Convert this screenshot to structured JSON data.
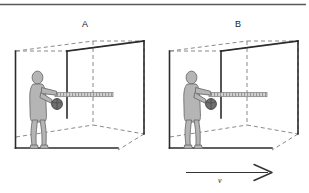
{
  "figure": {
    "type": "physics-diagram",
    "background_color": "#ffffff",
    "rule_color": "#595959",
    "panels": [
      {
        "id": "A",
        "label": "A",
        "label_x": 85,
        "label_y": 25,
        "box": {
          "style": "wireframe-perspective",
          "solid_edge_color": "#2b2b2b",
          "dashed_edge_color": "#777777",
          "front_left_vertical": true,
          "floor_line": true
        },
        "person": {
          "pose": "standing-arm-extended-throwing",
          "fill_color": "#b3b3b3",
          "outline_color": "#6e6e6e",
          "facing": "right"
        },
        "ball": {
          "shape": "sphere",
          "fill_color": "#6b6b6b",
          "outline_color": "#3a3a3a"
        },
        "trajectory_bar": {
          "style": "hatched-horizontal-bar",
          "fill_color": "#cfcfcf",
          "hatch_color": "#8a8a8a",
          "direction": "right"
        }
      },
      {
        "id": "B",
        "label": "B",
        "label_x": 238,
        "label_y": 25,
        "box": {
          "style": "wireframe-perspective",
          "solid_edge_color": "#2b2b2b",
          "dashed_edge_color": "#777777",
          "front_left_vertical": true,
          "floor_line": true
        },
        "person": {
          "pose": "standing-arm-extended-throwing",
          "fill_color": "#b3b3b3",
          "outline_color": "#6e6e6e",
          "facing": "right"
        },
        "ball": {
          "shape": "sphere",
          "fill_color": "#6b6b6b",
          "outline_color": "#3a3a3a"
        },
        "trajectory_bar": {
          "style": "hatched-horizontal-bar",
          "fill_color": "#cfcfcf",
          "hatch_color": "#8a8a8a",
          "direction": "right"
        }
      }
    ],
    "velocity_arrow": {
      "label": "v",
      "label_style": "italic",
      "direction": "right",
      "x_start": 186,
      "x_end": 272,
      "y": 173,
      "color": "#333333"
    },
    "top_rule": {
      "y": 4,
      "x_start": 0,
      "x_end": 306,
      "color": "#5a5a5a"
    }
  }
}
